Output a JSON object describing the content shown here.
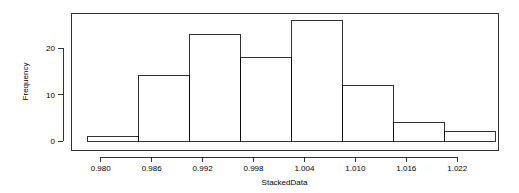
{
  "chart_data": {
    "type": "bar",
    "title": "",
    "subtitle": "",
    "xlabel": "StackedData",
    "ylabel": "Frequency",
    "grid": false,
    "legend": null,
    "legend_position": "none",
    "bin_edges": [
      0.9785,
      0.9845,
      0.9905,
      0.9965,
      1.0025,
      1.0085,
      1.0145,
      1.0205,
      1.0265
    ],
    "categories": [
      "0.9785-0.9845",
      "0.9845-0.9905",
      "0.9905-0.9965",
      "0.9965-1.0025",
      "1.0025-1.0085",
      "1.0085-1.0145",
      "1.0145-1.0205",
      "1.0205-1.0265"
    ],
    "values": [
      1,
      14,
      23,
      18,
      26,
      12,
      4,
      2
    ],
    "xlim": [
      0.9765,
      1.0268
    ],
    "ylim": [
      0,
      26
    ],
    "xticks": [
      0.98,
      0.986,
      0.992,
      0.998,
      1.004,
      1.01,
      1.016,
      1.022
    ],
    "xtick_labels": [
      "0.980",
      "0.986",
      "0.992",
      "0.998",
      "1.004",
      "1.010",
      "1.016",
      "1.022"
    ],
    "yticks": [
      0,
      10,
      20
    ],
    "ytick_labels": [
      "0",
      "10",
      "20"
    ]
  },
  "axes": {
    "x_title": "StackedData",
    "y_title": "Frequency"
  }
}
